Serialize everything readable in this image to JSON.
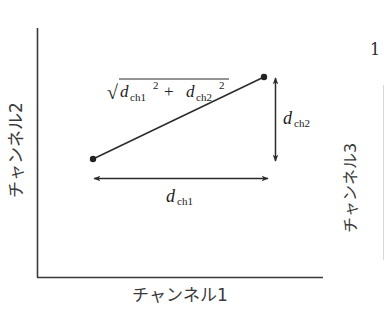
{
  "diagram": {
    "axes": {
      "x_label": "チャンネル1",
      "y_label": "チャンネル2"
    },
    "points": [
      {
        "name": "point-a",
        "x": 93,
        "y": 159
      },
      {
        "name": "point-b",
        "x": 264,
        "y": 77
      }
    ],
    "labels": {
      "distance_formula": {
        "sqrt": "√",
        "d1": "d",
        "d1_sub": "ch1",
        "d1_sup": "2",
        "plus": "+",
        "d2": "d",
        "d2_sub": "ch2",
        "d2_sup": "2"
      },
      "dx": {
        "d": "d",
        "sub": "ch1"
      },
      "dy": {
        "d": "d",
        "sub": "ch2"
      }
    },
    "adjacent_figure": {
      "number_fragment": "1",
      "y_label": "チャンネル3"
    },
    "colors": {
      "line": "#2b2b2b",
      "background": "#ffffff"
    }
  }
}
